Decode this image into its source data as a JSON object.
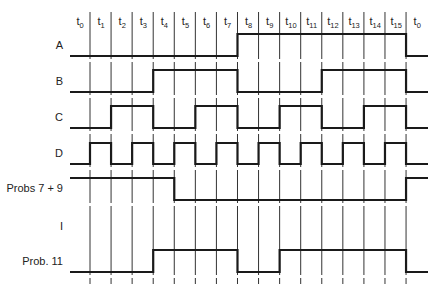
{
  "time_slots": [
    {
      "base": "t",
      "sub": "0"
    },
    {
      "base": "t",
      "sub": "1"
    },
    {
      "base": "t",
      "sub": "2"
    },
    {
      "base": "t",
      "sub": "3"
    },
    {
      "base": "t",
      "sub": "4"
    },
    {
      "base": "t",
      "sub": "5"
    },
    {
      "base": "t",
      "sub": "6"
    },
    {
      "base": "t",
      "sub": "7"
    },
    {
      "base": "t",
      "sub": "8"
    },
    {
      "base": "t",
      "sub": "9"
    },
    {
      "base": "t",
      "sub": "10"
    },
    {
      "base": "t",
      "sub": "11"
    },
    {
      "base": "t",
      "sub": "12"
    },
    {
      "base": "t",
      "sub": "13"
    },
    {
      "base": "t",
      "sub": "14"
    },
    {
      "base": "t",
      "sub": "15"
    },
    {
      "base": "t",
      "sub": "0"
    }
  ],
  "signals": [
    {
      "name": "A",
      "label": "A",
      "levels": [
        0,
        0,
        0,
        0,
        0,
        0,
        0,
        0,
        1,
        1,
        1,
        1,
        1,
        1,
        1,
        1,
        0
      ]
    },
    {
      "name": "B",
      "label": "B",
      "levels": [
        0,
        0,
        0,
        0,
        1,
        1,
        1,
        1,
        0,
        0,
        0,
        0,
        1,
        1,
        1,
        1,
        0
      ]
    },
    {
      "name": "C",
      "label": "C",
      "levels": [
        0,
        0,
        1,
        1,
        0,
        0,
        1,
        1,
        0,
        0,
        1,
        1,
        0,
        0,
        1,
        1,
        0
      ]
    },
    {
      "name": "D",
      "label": "D",
      "levels": [
        0,
        1,
        0,
        1,
        0,
        1,
        0,
        1,
        0,
        1,
        0,
        1,
        0,
        1,
        0,
        1,
        0
      ]
    },
    {
      "name": "probs-7-9",
      "label": "Probs 7 + 9",
      "levels": [
        1,
        1,
        1,
        1,
        1,
        0,
        0,
        0,
        0,
        0,
        0,
        0,
        0,
        0,
        0,
        0,
        1
      ]
    },
    {
      "name": "I",
      "label": "I",
      "levels": null
    },
    {
      "name": "prob-11",
      "label": "Prob. 11",
      "levels": [
        0,
        0,
        0,
        0,
        1,
        1,
        1,
        1,
        0,
        0,
        1,
        1,
        1,
        1,
        1,
        1,
        0
      ]
    }
  ],
  "colors": {
    "background": "#ffffff",
    "ink": "#1a1a1a"
  }
}
